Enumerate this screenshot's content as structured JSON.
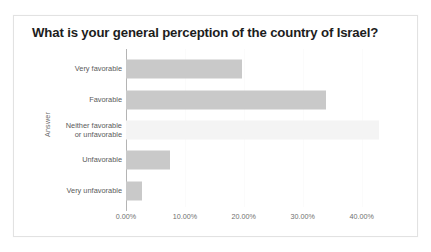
{
  "card": {
    "title": "What is your general perception of the country of Israel?"
  },
  "chart_data": {
    "type": "bar",
    "orientation": "horizontal",
    "title": "What is your general perception of the country of Israel?",
    "xlabel": "",
    "ylabel": "Answer",
    "categories": [
      "Very favorable",
      "Favorable",
      "Neither favorable\nor unfavorable",
      "Unfavorable",
      "Very unfavorable"
    ],
    "values": [
      19.7,
      33.9,
      43.0,
      7.5,
      2.8
    ],
    "value_labels": [
      "19.70%",
      "33.90%",
      "43.00%",
      "7.50%",
      "2.80%"
    ],
    "bar_styles": [
      "solid",
      "solid",
      "pale",
      "solid",
      "solid"
    ],
    "xlim": [
      0,
      46
    ],
    "xticks": [
      0,
      10,
      20,
      30,
      40
    ],
    "xtick_labels": [
      "0.00%",
      "10.00%",
      "20.00%",
      "30.00%",
      "40.00%"
    ],
    "grid": false,
    "legend": "none",
    "colors": {
      "bar": "#c9c9c9",
      "bar_pale": "#f4f4f4",
      "axis": "#b4b4b4",
      "title_text": "#1d1d1d",
      "tick_text": "#6f6f6f",
      "card_border": "#e2e2e2",
      "background": "#ffffff"
    }
  }
}
